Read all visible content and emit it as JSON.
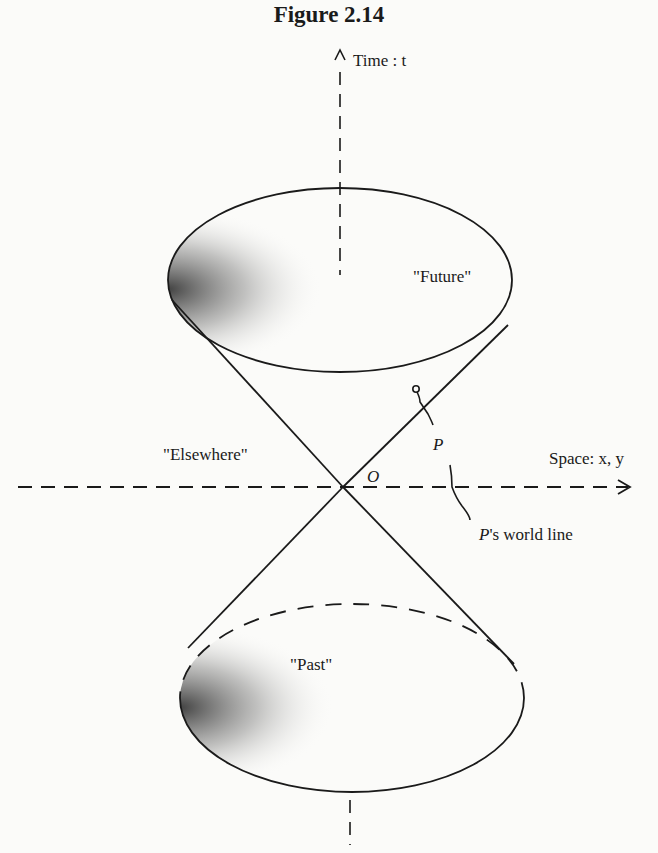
{
  "figure": {
    "title": "Figure 2.14",
    "axes": {
      "time_label": "Time : t",
      "space_label": "Space: x, y"
    },
    "regions": {
      "future": "\"Future\"",
      "past": "\"Past\"",
      "elsewhere": "\"Elsewhere\""
    },
    "points": {
      "origin": "O",
      "particle": "P"
    },
    "annotations": {
      "world_line_prefix": "P",
      "world_line_suffix": "'s world line"
    }
  }
}
